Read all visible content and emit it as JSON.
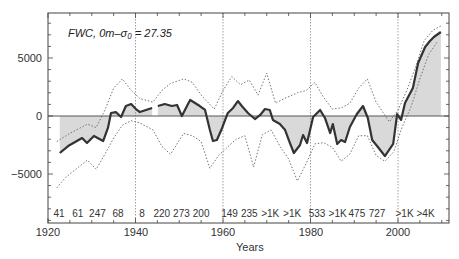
{
  "chart_data": {
    "type": "line",
    "title": "",
    "annotation": "FWC, 0m–σ₀ = 27.35",
    "xlabel": "Years",
    "ylabel": "",
    "xlim": [
      1920,
      2012
    ],
    "ylim": [
      -8500,
      9500
    ],
    "x_ticks": [
      1920,
      1940,
      1960,
      1980,
      2000
    ],
    "y_ticks": [
      -5000,
      0,
      5000
    ],
    "y_tick_labels": [
      "−5000",
      "0",
      "5000"
    ],
    "grid": false,
    "shaded_area_to_zero": true,
    "decade_dividers": [
      1940,
      1960,
      1980,
      2000
    ],
    "series": [
      {
        "name": "FWC mean",
        "style": "solid-thick",
        "x": [
          1922.7,
          1924.6,
          1927.8,
          1928.9,
          1930.5,
          1932.6,
          1933.7,
          1934.4,
          1935.5,
          1936.7,
          1937.8,
          1939.0,
          1940.1,
          1941.0,
          1942.4,
          1943.8,
          null,
          1945.1,
          1946.7,
          1948.3,
          1949.5,
          1950.6,
          1952.0,
          1952.5,
          1953.6,
          1954.7,
          1955.9,
          1957.0,
          1957.7,
          1958.6,
          1959.8,
          1961.1,
          1962.3,
          1963.4,
          1964.3,
          1965.7,
          1967.3,
          1968.5,
          1969.6,
          1970.7,
          1971.4,
          1973.0,
          1974.2,
          1975.3,
          1976.2,
          1977.6,
          1978.3,
          1979.2,
          1980.6,
          1982.2,
          1983.3,
          1984.5,
          1985.1,
          1986.1,
          1987.0,
          1987.9,
          1989.0,
          1990.6,
          1992.0,
          1993.1,
          1994.1,
          1995.4,
          1997.0,
          1998.9,
          1999.8,
          2000.7,
          2001.6,
          2003.4,
          2004.6,
          2006.2,
          2007.3,
          2008.2,
          2009.8
        ],
        "values": [
          -3190,
          -2590,
          -1900,
          -2330,
          -1720,
          -2160,
          -1030,
          260,
          340,
          -90,
          860,
          1030,
          600,
          340,
          520,
          690,
          null,
          860,
          1030,
          860,
          950,
          0,
          1030,
          1380,
          1120,
          860,
          520,
          -1210,
          -2160,
          -2070,
          -1030,
          260,
          690,
          1290,
          860,
          260,
          -260,
          90,
          600,
          520,
          -340,
          -690,
          -1210,
          -2330,
          -3190,
          -2500,
          -1640,
          -2330,
          -90,
          520,
          -170,
          -1470,
          -690,
          -2410,
          -2070,
          -2240,
          -950,
          170,
          860,
          -170,
          -2070,
          -2670,
          -3450,
          -2410,
          170,
          -340,
          1120,
          2410,
          4570,
          5950,
          6470,
          6810,
          7240
        ]
      },
      {
        "name": "upper envelope",
        "style": "dotted",
        "x": [
          1922,
          1925,
          1929,
          1931,
          1933,
          1935,
          1937,
          1939,
          1941,
          1944,
          1946,
          1948,
          1951,
          1953,
          1955,
          1958,
          1960,
          1962,
          1964,
          1966,
          1968,
          1970,
          1972,
          1974,
          1977,
          1979,
          1981,
          1983,
          1985,
          1987,
          1989,
          1991,
          1993,
          1995,
          1998,
          2000,
          2002,
          2004,
          2006,
          2008,
          2010
        ],
        "values": [
          -2200,
          -1500,
          -700,
          -1000,
          500,
          2400,
          3200,
          2200,
          1500,
          1200,
          2200,
          2800,
          3200,
          2900,
          1800,
          600,
          2200,
          3400,
          2700,
          3100,
          1800,
          3700,
          1100,
          1500,
          2000,
          2200,
          2900,
          1600,
          600,
          700,
          1100,
          2400,
          3200,
          1200,
          -500,
          500,
          2200,
          4200,
          6500,
          7400,
          7800
        ]
      },
      {
        "name": "lower envelope",
        "style": "dotted",
        "x": [
          1922,
          1924,
          1927,
          1929,
          1931,
          1933,
          1935,
          1937,
          1939,
          1941,
          1944,
          1946,
          1948,
          1951,
          1953,
          1955,
          1957,
          1959,
          1961,
          1963,
          1965,
          1967,
          1969,
          1971,
          1973,
          1975,
          1977,
          1979,
          1981,
          1983,
          1985,
          1987,
          1989,
          1991,
          1993,
          1995,
          1997,
          1999,
          2001,
          2003,
          2005,
          2007,
          2009
        ],
        "values": [
          -6200,
          -5300,
          -4400,
          -3800,
          -4600,
          -3300,
          -1900,
          -800,
          -400,
          -600,
          -1200,
          -2600,
          -3300,
          -1500,
          -1700,
          -2200,
          -4500,
          -3400,
          -2700,
          -2000,
          -1700,
          -4400,
          -1600,
          -1200,
          -2600,
          -3700,
          -5600,
          -4100,
          -2400,
          -2300,
          -2700,
          -3900,
          -3300,
          -1700,
          -1700,
          -3400,
          -3900,
          -3100,
          -900,
          800,
          3200,
          5300,
          6400
        ]
      }
    ],
    "sample_counts": [
      {
        "x": 1922.5,
        "label": "41"
      },
      {
        "x": 1926.8,
        "label": "61"
      },
      {
        "x": 1931.3,
        "label": "247"
      },
      {
        "x": 1936,
        "label": "68"
      },
      {
        "x": 1941.5,
        "label": "8"
      },
      {
        "x": 1946,
        "label": "220"
      },
      {
        "x": 1950.5,
        "label": "273"
      },
      {
        "x": 1955,
        "label": "200"
      },
      {
        "x": 1961.5,
        "label": "149"
      },
      {
        "x": 1966,
        "label": "235"
      },
      {
        "x": 1970.8,
        "label": ">1K"
      },
      {
        "x": 1975.8,
        "label": ">1K"
      },
      {
        "x": 1981.5,
        "label": "533"
      },
      {
        "x": 1986.2,
        "label": ">1K"
      },
      {
        "x": 1990.6,
        "label": "475"
      },
      {
        "x": 1995.2,
        "label": "727"
      },
      {
        "x": 2001.5,
        "label": ">1K"
      },
      {
        "x": 2006.3,
        "label": ">4K"
      }
    ],
    "colors": {
      "main_line": "#333333",
      "fill": "#d9d9d9",
      "dotted": "#666666",
      "axis": "#444444"
    }
  }
}
